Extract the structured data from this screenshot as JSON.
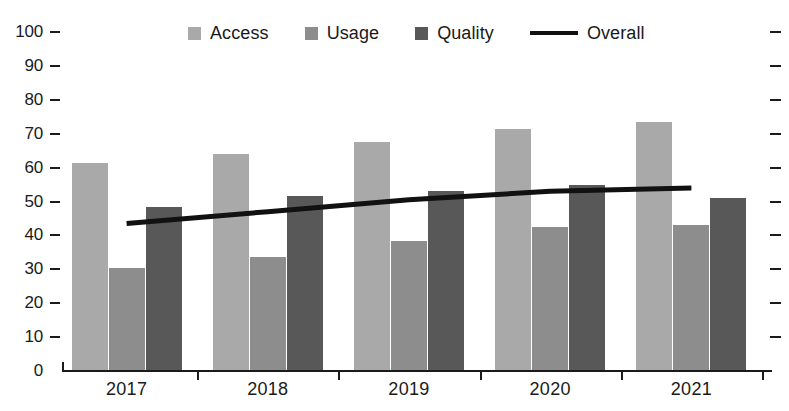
{
  "chart_data": {
    "type": "bar",
    "title": "",
    "xlabel": "",
    "ylabel": "",
    "categories": [
      "2017",
      "2018",
      "2019",
      "2020",
      "2021"
    ],
    "ylim": [
      0,
      100
    ],
    "y_ticks": [
      0,
      10,
      20,
      30,
      40,
      50,
      60,
      70,
      80,
      90,
      100
    ],
    "grid": false,
    "legend_position": "top-center",
    "series": [
      {
        "name": "Access",
        "type": "bar",
        "color": "#a9a9a9",
        "values": [
          61.5,
          64.0,
          67.5,
          71.5,
          73.5
        ]
      },
      {
        "name": "Usage",
        "type": "bar",
        "color": "#8d8d8d",
        "values": [
          30.5,
          33.5,
          38.5,
          42.5,
          43.0
        ]
      },
      {
        "name": "Quality",
        "type": "bar",
        "color": "#585858",
        "values": [
          48.5,
          51.5,
          53.0,
          55.0,
          51.0
        ]
      },
      {
        "name": "Overall",
        "type": "line",
        "color": "#111111",
        "values": [
          43.5,
          47.0,
          50.5,
          53.0,
          54.0
        ]
      }
    ]
  },
  "legend": {
    "items": [
      {
        "label": "Access",
        "marker": "square",
        "color": "#a9a9a9"
      },
      {
        "label": "Usage",
        "marker": "square",
        "color": "#8d8d8d"
      },
      {
        "label": "Quality",
        "marker": "square",
        "color": "#585858"
      },
      {
        "label": "Overall",
        "marker": "line",
        "color": "#111111"
      }
    ]
  },
  "axis": {
    "y_tick_labels": [
      "100",
      "90",
      "80",
      "70",
      "60",
      "50",
      "40",
      "30",
      "20",
      "10",
      "0"
    ],
    "x_tick_labels": [
      "2017",
      "2018",
      "2019",
      "2020",
      "2021"
    ]
  }
}
